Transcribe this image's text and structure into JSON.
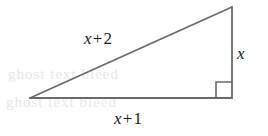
{
  "figure": {
    "type": "right-triangle-diagram",
    "background_color": "#ffffff",
    "stroke_color": "#6a6a6a",
    "text_color": "#1b1b1b",
    "ghost_color": "#e9e8e6",
    "vertices": {
      "left": {
        "x": 30,
        "y": 98
      },
      "top_right": {
        "x": 232,
        "y": 7
      },
      "bottom_right": {
        "x": 232,
        "y": 98
      }
    },
    "right_angle_marker": {
      "at_vertex": "bottom_right",
      "size": 16
    },
    "labels": {
      "hypotenuse": {
        "var": "x",
        "op": "+",
        "num": "2",
        "full": "x + 2"
      },
      "vertical_leg": {
        "var": "x",
        "full": "x"
      },
      "base": {
        "var": "x",
        "op": "+",
        "num": "1",
        "full": "x + 1"
      }
    },
    "ghost_text": {
      "line1": "ghost text bleed",
      "line2": "ghost text bleed"
    }
  }
}
